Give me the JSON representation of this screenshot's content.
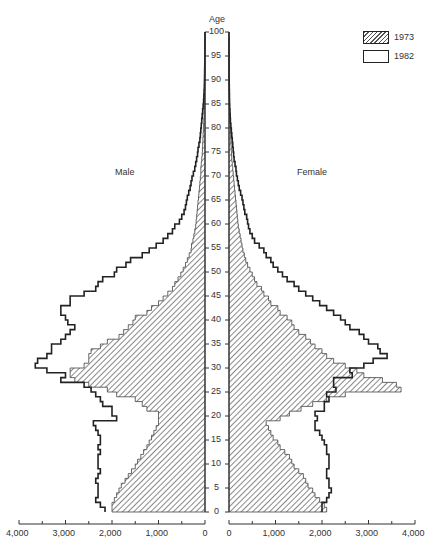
{
  "chart_data": {
    "type": "population_pyramid",
    "title": "",
    "center_axis_label": "Age",
    "side_labels": {
      "left": "Male",
      "right": "Female"
    },
    "age_ticks": [
      0,
      5,
      10,
      15,
      20,
      25,
      30,
      35,
      40,
      45,
      50,
      55,
      60,
      65,
      70,
      75,
      80,
      85,
      90,
      95,
      100
    ],
    "x_ticks_male": [
      "4,000",
      "3,000",
      "2,000",
      "1,000",
      "0"
    ],
    "x_ticks_female": [
      "0",
      "1,000",
      "2,000",
      "3,000",
      "4,000"
    ],
    "xlim": [
      0,
      4000
    ],
    "ylim": [
      0,
      100
    ],
    "legend": [
      {
        "label": "1973",
        "style": "hatched"
      },
      {
        "label": "1982",
        "style": "outline"
      }
    ],
    "ages": "0-99 (single years)",
    "series": [
      {
        "name": "1973 Male",
        "values": [
          2000,
          2000,
          1950,
          1900,
          1850,
          1800,
          1720,
          1650,
          1580,
          1500,
          1450,
          1380,
          1320,
          1250,
          1200,
          1150,
          1100,
          1050,
          1000,
          1000,
          1000,
          1250,
          1350,
          1500,
          1900,
          2100,
          2500,
          2800,
          2900,
          2900,
          2600,
          2500,
          2500,
          2450,
          2250,
          2100,
          1850,
          1750,
          1650,
          1550,
          1500,
          1250,
          1150,
          1000,
          900,
          800,
          700,
          650,
          580,
          520,
          470,
          420,
          380,
          340,
          300,
          290,
          260,
          240,
          220,
          200,
          190,
          180,
          170,
          160,
          150,
          140,
          130,
          120,
          110,
          100,
          90,
          90,
          80,
          70,
          60,
          55,
          50,
          45,
          40,
          35,
          30,
          25,
          20,
          18,
          15,
          12,
          10,
          8,
          6,
          5,
          4,
          3,
          2,
          2,
          1,
          1,
          1,
          0,
          0,
          0
        ]
      },
      {
        "name": "1982 Male",
        "values": [
          2150,
          2250,
          2350,
          2300,
          2300,
          2300,
          2350,
          2300,
          2250,
          2300,
          2300,
          2300,
          2250,
          2300,
          2250,
          2250,
          2300,
          2350,
          2400,
          1900,
          2000,
          2000,
          2200,
          2250,
          2350,
          2450,
          2600,
          3100,
          3000,
          3400,
          3650,
          3600,
          3400,
          3300,
          3300,
          3100,
          3000,
          2900,
          2800,
          2950,
          3000,
          3100,
          3100,
          2900,
          2900,
          2600,
          2350,
          2300,
          2200,
          1950,
          1900,
          1700,
          1600,
          1350,
          1200,
          1050,
          900,
          800,
          700,
          650,
          550,
          500,
          450,
          420,
          400,
          380,
          350,
          320,
          300,
          280,
          250,
          220,
          200,
          180,
          160,
          150,
          130,
          110,
          100,
          90,
          80,
          70,
          60,
          50,
          40,
          30,
          25,
          20,
          15,
          12,
          10,
          8,
          6,
          4,
          3,
          2,
          1,
          1,
          0,
          0
        ]
      },
      {
        "name": "1973 Female",
        "values": [
          2100,
          2050,
          1950,
          1850,
          1800,
          1700,
          1650,
          1600,
          1500,
          1400,
          1350,
          1300,
          1200,
          1100,
          1050,
          950,
          900,
          850,
          800,
          1100,
          1300,
          1550,
          1800,
          2100,
          2500,
          3700,
          3600,
          3300,
          2900,
          2750,
          2500,
          2250,
          2100,
          2000,
          1850,
          1750,
          1650,
          1500,
          1400,
          1350,
          1250,
          1100,
          1050,
          900,
          850,
          750,
          700,
          600,
          550,
          500,
          450,
          400,
          360,
          330,
          300,
          280,
          260,
          240,
          220,
          200,
          190,
          180,
          170,
          160,
          150,
          140,
          130,
          120,
          110,
          100,
          90,
          80,
          70,
          60,
          55,
          50,
          45,
          40,
          35,
          30,
          25,
          20,
          18,
          15,
          12,
          10,
          8,
          6,
          5,
          4,
          3,
          2,
          2,
          1,
          1,
          1,
          0,
          0,
          0
        ]
      },
      {
        "name": "1982 Female",
        "values": [
          2000,
          2000,
          2100,
          2150,
          2200,
          2150,
          2150,
          2100,
          2100,
          2150,
          2150,
          2150,
          2100,
          2100,
          2050,
          2000,
          1950,
          1850,
          1850,
          1900,
          1850,
          2050,
          2050,
          2150,
          2100,
          2300,
          2250,
          2250,
          2650,
          2600,
          2900,
          3100,
          3400,
          3250,
          3200,
          3000,
          2900,
          2800,
          2600,
          2500,
          2400,
          2250,
          2100,
          1950,
          1800,
          1650,
          1500,
          1400,
          1250,
          1150,
          1050,
          950,
          900,
          800,
          750,
          650,
          550,
          500,
          450,
          420,
          400,
          380,
          340,
          320,
          300,
          280,
          250,
          220,
          200,
          180,
          160,
          150,
          130,
          110,
          100,
          90,
          80,
          70,
          60,
          50,
          40,
          30,
          25,
          20,
          15,
          12,
          10,
          8,
          6,
          4,
          3,
          2,
          1,
          1,
          0,
          0,
          0,
          0,
          0,
          0
        ]
      }
    ],
    "colors": {
      "line": "#222222",
      "hatch": "#555555",
      "background": "#ffffff"
    }
  },
  "labels": {
    "age": "Age",
    "male": "Male",
    "female": "Female",
    "legend_1973": "1973",
    "legend_1982": "1982"
  }
}
